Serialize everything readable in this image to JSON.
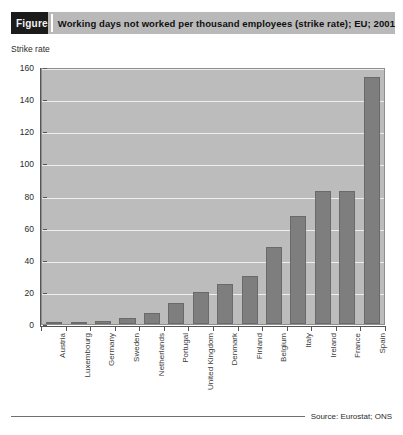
{
  "figure": {
    "tag_label": "Figure",
    "title": "Working days not worked per thousand employees (strike rate); EU; 2001",
    "source": "Source: Eurostat; ONS"
  },
  "colors": {
    "banner_bg": "#b9b9b9",
    "tag_bg": "#1b1b1b",
    "plot_bg": "#bcbcbc",
    "bar_fill": "#7e7e7e",
    "gridline": "#eeeeee",
    "axis": "#555555"
  },
  "chart_data": {
    "type": "bar",
    "title": "Working days not worked per thousand employees (strike rate); EU; 2001",
    "subtitle": "",
    "xlabel": "",
    "ylabel": "Strike rate",
    "ylim": [
      0,
      160
    ],
    "yticks": [
      0,
      20,
      40,
      60,
      80,
      100,
      120,
      140,
      160
    ],
    "ytick_labels": [
      "0",
      "20",
      "40",
      "60",
      "80",
      "100",
      "120",
      "140",
      "160"
    ],
    "grid": "horizontal",
    "legend": "none",
    "categories": [
      "Austria",
      "Luxembourg",
      "Germany",
      "Sweden",
      "Netherlands",
      "Portugal",
      "United Kingdom",
      "Denmark",
      "Finland",
      "Belgium",
      "Italy",
      "Ireland",
      "France",
      "Spain"
    ],
    "values": [
      0,
      1,
      2,
      4,
      7,
      13,
      20,
      25,
      30,
      48,
      67,
      83,
      83,
      154
    ]
  }
}
